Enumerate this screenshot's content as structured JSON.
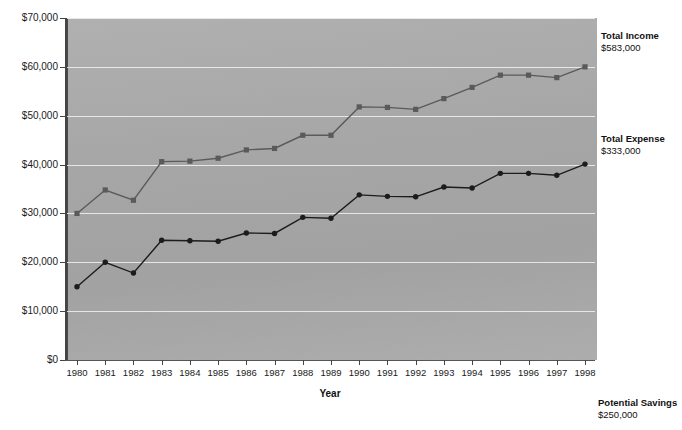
{
  "chart_data": {
    "type": "line",
    "title": "",
    "xlabel": "Year",
    "ylabel": "",
    "grid": true,
    "legend_position": "right-annotations",
    "categories": [
      "1980",
      "1981",
      "1982",
      "1983",
      "1984",
      "1985",
      "1986",
      "1987",
      "1988",
      "1989",
      "1990",
      "1991",
      "1992",
      "1993",
      "1994",
      "1995",
      "1996",
      "1997",
      "1998"
    ],
    "ylim": [
      0,
      70000
    ],
    "yticks": [
      0,
      10000,
      20000,
      30000,
      40000,
      50000,
      60000,
      70000
    ],
    "ytick_labels": [
      "$0",
      "$10,000",
      "$20,000",
      "$30,000",
      "$40,000",
      "$50,000",
      "$60,000",
      "$70,000"
    ],
    "series": [
      {
        "name": "Total Income",
        "marker": "square",
        "color": "#5a5a5a",
        "values": [
          30000,
          34800,
          32700,
          40600,
          40700,
          41300,
          43000,
          43300,
          46000,
          46000,
          51800,
          51700,
          51300,
          53500,
          55800,
          58300,
          58300,
          57800,
          60000
        ]
      },
      {
        "name": "Total Expense",
        "marker": "circle",
        "color": "#1c1c1c",
        "values": [
          15000,
          20000,
          17800,
          24500,
          24400,
          24300,
          26000,
          25900,
          29200,
          29000,
          33800,
          33500,
          33400,
          35400,
          35200,
          38200,
          38200,
          37800,
          40100
        ]
      }
    ],
    "annotations": [
      {
        "id": "income",
        "title": "Total Income",
        "value": "$583,000"
      },
      {
        "id": "expense",
        "title": "Total Expense",
        "value": "$333,000"
      },
      {
        "id": "savings",
        "title": "Potential Savings",
        "value": "$250,000"
      }
    ]
  }
}
